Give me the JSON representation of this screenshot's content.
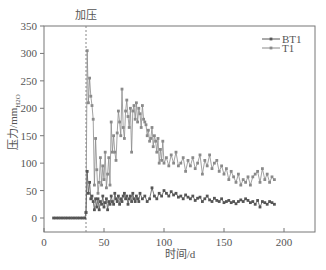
{
  "chart_data": {
    "type": "line",
    "title": "",
    "annotation": "加压",
    "annotation_x": 35,
    "xlabel": "时间/d",
    "ylabel": "压力/mmH2O",
    "ylabel_main": "压力/mm",
    "ylabel_sub": "H2O",
    "xlim": [
      0,
      225
    ],
    "ylim": [
      -25,
      350
    ],
    "xticks": [
      0,
      50,
      100,
      150,
      200
    ],
    "yticks": [
      0,
      50,
      100,
      150,
      200,
      250,
      300,
      350
    ],
    "grid": false,
    "legend_position": "upper right",
    "legend": [
      "BT1",
      "T1"
    ],
    "colors": {
      "BT1": "#555555",
      "T1": "#8a8a8a",
      "axis": "#777777",
      "dash": "#888888"
    },
    "series": [
      {
        "name": "BT1",
        "x": [
          8,
          10,
          12,
          14,
          16,
          18,
          20,
          22,
          24,
          26,
          28,
          30,
          32,
          34,
          35,
          36,
          37,
          38,
          39,
          40,
          41,
          42,
          43,
          44,
          45,
          46,
          47,
          48,
          49,
          50,
          51,
          52,
          53,
          54,
          55,
          56,
          57,
          58,
          59,
          60,
          61,
          62,
          63,
          64,
          65,
          66,
          67,
          68,
          69,
          70,
          71,
          72,
          73,
          74,
          75,
          76,
          77,
          78,
          79,
          80,
          82,
          84,
          86,
          88,
          90,
          92,
          94,
          96,
          98,
          100,
          102,
          104,
          106,
          108,
          110,
          112,
          114,
          116,
          118,
          120,
          122,
          124,
          126,
          128,
          130,
          132,
          134,
          136,
          138,
          140,
          142,
          144,
          146,
          148,
          150,
          152,
          154,
          156,
          158,
          160,
          162,
          164,
          166,
          168,
          170,
          172,
          174,
          176,
          178,
          180,
          182,
          184,
          186,
          188,
          190,
          192
        ],
        "values": [
          0,
          0,
          0,
          0,
          0,
          0,
          0,
          0,
          0,
          0,
          0,
          0,
          0,
          0,
          10,
          85,
          45,
          65,
          35,
          40,
          30,
          15,
          35,
          20,
          35,
          15,
          30,
          25,
          40,
          20,
          28,
          35,
          15,
          30,
          25,
          40,
          30,
          25,
          45,
          35,
          30,
          40,
          25,
          35,
          30,
          40,
          45,
          35,
          40,
          25,
          35,
          40,
          30,
          45,
          35,
          30,
          40,
          35,
          30,
          45,
          35,
          40,
          30,
          35,
          55,
          40,
          35,
          45,
          40,
          50,
          45,
          40,
          48,
          42,
          45,
          38,
          40,
          35,
          42,
          38,
          35,
          40,
          32,
          36,
          38,
          30,
          35,
          40,
          33,
          30,
          36,
          32,
          30,
          35,
          28,
          30,
          32,
          28,
          30,
          26,
          30,
          33,
          30,
          35,
          32,
          28,
          30,
          25,
          32,
          20,
          30,
          28,
          25,
          30,
          28,
          25
        ]
      },
      {
        "name": "T1",
        "x": [
          35,
          36,
          37,
          38,
          39,
          40,
          41,
          42,
          43,
          44,
          45,
          46,
          47,
          48,
          49,
          50,
          51,
          52,
          53,
          54,
          55,
          56,
          57,
          58,
          59,
          60,
          61,
          62,
          63,
          64,
          65,
          66,
          67,
          68,
          69,
          70,
          71,
          72,
          73,
          74,
          75,
          76,
          77,
          78,
          79,
          80,
          81,
          82,
          83,
          84,
          85,
          86,
          87,
          88,
          89,
          90,
          91,
          92,
          93,
          94,
          95,
          96,
          97,
          98,
          99,
          100,
          102,
          104,
          106,
          108,
          110,
          112,
          114,
          116,
          118,
          120,
          122,
          124,
          126,
          128,
          130,
          132,
          134,
          136,
          138,
          140,
          142,
          144,
          146,
          148,
          150,
          152,
          154,
          156,
          158,
          160,
          162,
          164,
          166,
          168,
          170,
          172,
          174,
          176,
          178,
          180,
          182,
          184,
          186,
          188,
          190,
          192
        ],
        "values": [
          10,
          305,
          210,
          255,
          222,
          205,
          180,
          60,
          145,
          88,
          45,
          65,
          110,
          60,
          95,
          70,
          120,
          55,
          80,
          110,
          60,
          175,
          120,
          150,
          120,
          105,
          155,
          195,
          175,
          150,
          235,
          165,
          145,
          195,
          215,
          185,
          165,
          200,
          120,
          195,
          205,
          180,
          210,
          175,
          200,
          190,
          165,
          205,
          180,
          175,
          170,
          150,
          160,
          140,
          145,
          165,
          130,
          150,
          140,
          120,
          145,
          100,
          125,
          105,
          140,
          100,
          110,
          95,
          115,
          100,
          120,
          95,
          100,
          110,
          85,
          105,
          95,
          110,
          90,
          100,
          115,
          80,
          105,
          95,
          115,
          90,
          100,
          105,
          85,
          95,
          80,
          90,
          70,
          85,
          75,
          65,
          80,
          60,
          70,
          65,
          75,
          60,
          75,
          80,
          85,
          65,
          90,
          70,
          80,
          65,
          75,
          70
        ]
      }
    ]
  }
}
